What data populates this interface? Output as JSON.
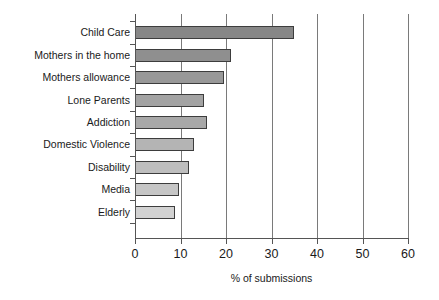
{
  "chart_data": {
    "type": "bar",
    "orientation": "horizontal",
    "title": "",
    "xlabel": "% of submissions",
    "ylabel": "",
    "xlim": [
      0,
      60
    ],
    "xticks": [
      0,
      10,
      20,
      30,
      40,
      50,
      60
    ],
    "xtick_labels": [
      "0",
      "10",
      "20",
      "30",
      "40",
      "50",
      "60"
    ],
    "grid": "vertical",
    "legend": "none",
    "categories": [
      "Child Care",
      "Mothers in the home",
      "Mothers allowance",
      "Lone Parents",
      "Addiction",
      "Domestic Violence",
      "Disability",
      "Media",
      "Elderly"
    ],
    "values": [
      35,
      21,
      19.5,
      15.2,
      15.8,
      13,
      11.8,
      9.7,
      8.8
    ],
    "bar_colors": [
      "#878787",
      "#8f8f8f",
      "#989898",
      "#a3a3a3",
      "#a8a8a8",
      "#b4b4b4",
      "#bebebe",
      "#c6c6c6",
      "#d2d2d2"
    ],
    "bar_edge_color": "#3d3d3d",
    "axis_color": "#555555",
    "grid_color": "#7a7a7a",
    "background_color": "#ffffff"
  }
}
